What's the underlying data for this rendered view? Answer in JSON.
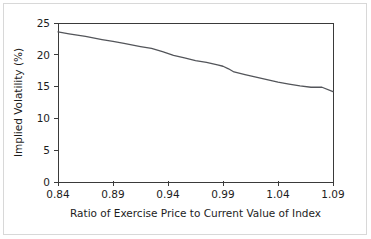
{
  "chart_data": {
    "type": "line",
    "title": "",
    "xlabel": "Ratio of Exercise Price to Current Value of Index",
    "ylabel": "Implied Volatility (%)",
    "xlim": [
      0.84,
      1.09
    ],
    "ylim": [
      0,
      25
    ],
    "xticks": [
      "0.84",
      "0.89",
      "0.94",
      "0.99",
      "1.04",
      "1.09"
    ],
    "xtick_values": [
      0.84,
      0.89,
      0.94,
      0.99,
      1.04,
      1.09
    ],
    "yticks": [
      "0",
      "5",
      "10",
      "15",
      "20",
      "25"
    ],
    "ytick_values": [
      0,
      5,
      10,
      15,
      20,
      25
    ],
    "grid": false,
    "legend": "none",
    "series": [
      {
        "name": "Implied volatility",
        "color": "#53555a",
        "x": [
          0.84,
          0.85,
          0.865,
          0.88,
          0.89,
          0.9,
          0.915,
          0.925,
          0.935,
          0.945,
          0.955,
          0.965,
          0.975,
          0.985,
          0.99,
          0.995,
          1.0,
          1.01,
          1.02,
          1.03,
          1.04,
          1.05,
          1.06,
          1.07,
          1.08,
          1.09
        ],
        "y": [
          23.6,
          23.3,
          22.9,
          22.4,
          22.1,
          21.8,
          21.3,
          21.0,
          20.5,
          19.9,
          19.5,
          19.1,
          18.8,
          18.4,
          18.2,
          17.8,
          17.3,
          16.9,
          16.5,
          16.1,
          15.7,
          15.4,
          15.1,
          14.9,
          14.9,
          14.2
        ]
      }
    ]
  },
  "figure": {
    "background_color": "#ffffff",
    "frame_color": "#d8d8d8",
    "axis_color": "#3a3a3a"
  }
}
